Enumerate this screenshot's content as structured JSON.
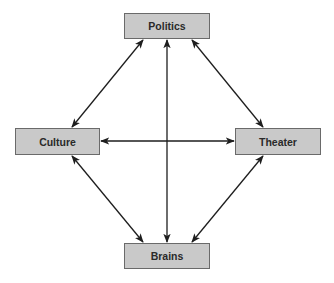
{
  "diagram": {
    "nodes": [
      {
        "id": "politics",
        "label": "Politics",
        "x": 124,
        "y": 13,
        "w": 86,
        "h": 26
      },
      {
        "id": "culture",
        "label": "Culture",
        "x": 15,
        "y": 128,
        "w": 85,
        "h": 27
      },
      {
        "id": "theater",
        "label": "Theater",
        "x": 235,
        "y": 128,
        "w": 86,
        "h": 27
      },
      {
        "id": "brains",
        "label": "Brains",
        "x": 124,
        "y": 243,
        "w": 86,
        "h": 26
      }
    ],
    "edges": [
      {
        "from": "politics",
        "to": "culture",
        "bidirectional": true
      },
      {
        "from": "politics",
        "to": "theater",
        "bidirectional": true
      },
      {
        "from": "politics",
        "to": "brains",
        "bidirectional": true
      },
      {
        "from": "culture",
        "to": "theater",
        "bidirectional": true
      },
      {
        "from": "culture",
        "to": "brains",
        "bidirectional": true
      },
      {
        "from": "theater",
        "to": "brains",
        "bidirectional": true
      }
    ],
    "colors": {
      "box_fill": "#c9c9c9",
      "box_border": "#6a6a6a",
      "line": "#1e1e1e"
    }
  }
}
